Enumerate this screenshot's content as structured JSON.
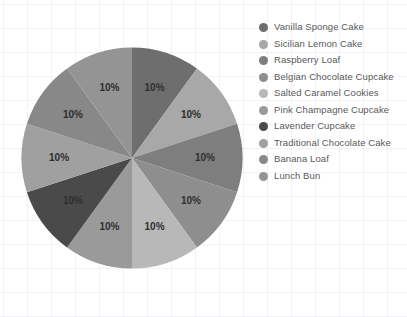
{
  "chart_data": {
    "type": "pie",
    "title": "",
    "subtitle": "",
    "xlabel": "",
    "ylabel": "",
    "legend_position": "right",
    "grid": true,
    "value_suffix": "%",
    "start_angle_deg": 0,
    "direction": "clockwise",
    "categories": [
      "Vanilla Sponge Cake",
      "Sicilian Lemon Cake",
      "Raspberry Loaf",
      "Belgian Chocolate Cupcake",
      "Salted Caramel Cookies",
      "Pink Champagne Cupcake",
      "Lavender Cupcake",
      "Traditional Chocolate Cake",
      "Banana Loaf",
      "Lunch Bun"
    ],
    "values": [
      10,
      10,
      10,
      10,
      10,
      10,
      10,
      10,
      10,
      10
    ],
    "data_labels": [
      "10%",
      "10%",
      "10%",
      "10%",
      "10%",
      "10%",
      "10%",
      "10%",
      "10%",
      "10%"
    ],
    "colors": [
      "#6e6e6e",
      "#a8a8a8",
      "#7e7e7e",
      "#8e8e8e",
      "#b8b8b8",
      "#9a9a9a",
      "#4a4a4a",
      "#a0a0a0",
      "#888888",
      "#949494"
    ]
  },
  "legend": {
    "items": [
      {
        "label": "Vanilla Sponge Cake",
        "color": "#6e6e6e"
      },
      {
        "label": "Sicilian Lemon Cake",
        "color": "#a8a8a8"
      },
      {
        "label": "Raspberry Loaf",
        "color": "#7e7e7e"
      },
      {
        "label": "Belgian Chocolate Cupcake",
        "color": "#8e8e8e"
      },
      {
        "label": "Salted Caramel Cookies",
        "color": "#b8b8b8"
      },
      {
        "label": "Pink Champagne Cupcake",
        "color": "#9a9a9a"
      },
      {
        "label": "Lavender Cupcake",
        "color": "#4a4a4a"
      },
      {
        "label": "Traditional Chocolate Cake",
        "color": "#a0a0a0"
      },
      {
        "label": "Banana Loaf",
        "color": "#888888"
      },
      {
        "label": "Lunch Bun",
        "color": "#949494"
      }
    ]
  }
}
